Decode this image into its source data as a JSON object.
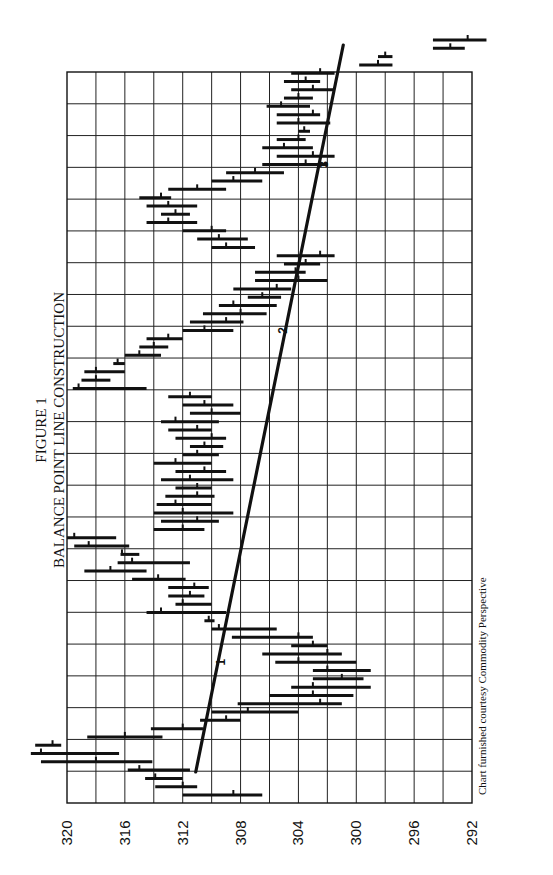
{
  "chart_data": {
    "type": "bar",
    "subtype": "high-low-close price bars with trend line",
    "title": "FIGURE 1",
    "subtitle": "BALANCE POINT LINE CONSTRUCTION",
    "credit": "Chart furnished courtesy Commodity Perspective",
    "orientation": "rotated 90 degrees counter-clockwise (time runs bottom to top, price runs left to right decreasing)",
    "price_axis": {
      "label": "",
      "ticks": [
        320,
        316,
        312,
        308,
        304,
        300,
        296,
        292
      ],
      "range": [
        292,
        320
      ],
      "grid": true
    },
    "time_axis": {
      "label": "",
      "grid": true,
      "divisions": 23
    },
    "balance_line": {
      "start": {
        "bar": 0,
        "price": 311.1
      },
      "end": {
        "bar": 92,
        "price": 300.9
      },
      "labels": [
        {
          "text": "1",
          "bar": 16,
          "price": 309.9
        },
        {
          "text": "2",
          "bar": 56,
          "price": 305.6
        },
        {
          "text": "3",
          "bar": 76,
          "price": 302.8
        }
      ]
    },
    "bars": [
      {
        "hi": 312.0,
        "lo": 306.5,
        "c": 308.5
      },
      {
        "hi": 313.9,
        "lo": 311.0,
        "c": 312.0
      },
      {
        "hi": 314.6,
        "lo": 312.0,
        "c": 313.9
      },
      {
        "hi": 315.8,
        "lo": 311.5,
        "c": 315.0
      },
      {
        "hi": 321.8,
        "lo": 314.1,
        "c": 318.0
      },
      {
        "hi": 322.5,
        "lo": 316.4,
        "c": 321.8
      },
      {
        "hi": 322.2,
        "lo": 320.4,
        "c": 321.0
      },
      {
        "hi": 318.6,
        "lo": 313.4,
        "c": 316.0
      },
      {
        "hi": 314.2,
        "lo": 310.6,
        "c": 312.0
      },
      {
        "hi": 310.8,
        "lo": 308.0,
        "c": 309.0
      },
      {
        "hi": 310.0,
        "lo": 304.0,
        "c": 307.5
      },
      {
        "hi": 308.2,
        "lo": 301.0,
        "c": 302.5
      },
      {
        "hi": 306.0,
        "lo": 300.2,
        "c": 303.0
      },
      {
        "hi": 304.5,
        "lo": 299.0,
        "c": 303.0
      },
      {
        "hi": 303.0,
        "lo": 299.5,
        "c": 301.0
      },
      {
        "hi": 303.0,
        "lo": 299.0,
        "c": 302.0
      },
      {
        "hi": 305.6,
        "lo": 300.0,
        "c": 304.0
      },
      {
        "hi": 306.5,
        "lo": 301.0,
        "c": 302.0
      },
      {
        "hi": 304.5,
        "lo": 302.0,
        "c": 303.0
      },
      {
        "hi": 308.6,
        "lo": 303.0,
        "c": 304.0
      },
      {
        "hi": 310.0,
        "lo": 305.5,
        "c": 309.5
      },
      {
        "hi": 310.5,
        "lo": 309.8,
        "c": 310.2
      },
      {
        "hi": 314.5,
        "lo": 309.0,
        "c": 313.5
      },
      {
        "hi": 312.5,
        "lo": 310.0,
        "c": 312.0
      },
      {
        "hi": 313.0,
        "lo": 310.5,
        "c": 311.5
      },
      {
        "hi": 313.0,
        "lo": 310.2,
        "c": 311.2
      },
      {
        "hi": 315.5,
        "lo": 311.8,
        "c": 313.7
      },
      {
        "hi": 318.8,
        "lo": 314.5,
        "c": 317.0
      },
      {
        "hi": 316.5,
        "lo": 311.5,
        "c": 315.5
      },
      {
        "hi": 316.3,
        "lo": 315.0,
        "c": 316.2
      },
      {
        "hi": 319.5,
        "lo": 315.7,
        "c": 318.5
      },
      {
        "hi": 320.0,
        "lo": 316.6,
        "c": 319.5
      },
      {
        "hi": 314.0,
        "lo": 310.5,
        "c": 312.0
      },
      {
        "hi": 313.5,
        "lo": 309.5,
        "c": 311.0
      },
      {
        "hi": 314.0,
        "lo": 308.5,
        "c": 312.0
      },
      {
        "hi": 313.8,
        "lo": 310.0,
        "c": 312.5
      },
      {
        "hi": 313.2,
        "lo": 309.8,
        "c": 311.0
      },
      {
        "hi": 312.5,
        "lo": 310.0,
        "c": 311.0
      },
      {
        "hi": 313.5,
        "lo": 308.5,
        "c": 311.5
      },
      {
        "hi": 312.5,
        "lo": 309.0,
        "c": 310.5
      },
      {
        "hi": 314.0,
        "lo": 310.0,
        "c": 312.5
      },
      {
        "hi": 312.0,
        "lo": 309.5,
        "c": 311.0
      },
      {
        "hi": 311.5,
        "lo": 309.2,
        "c": 310.5
      },
      {
        "hi": 312.5,
        "lo": 309.0,
        "c": 310.0
      },
      {
        "hi": 313.0,
        "lo": 310.0,
        "c": 311.0
      },
      {
        "hi": 313.5,
        "lo": 309.5,
        "c": 312.5
      },
      {
        "hi": 311.5,
        "lo": 308.0,
        "c": 310.0
      },
      {
        "hi": 312.0,
        "lo": 308.5,
        "c": 310.5
      },
      {
        "hi": 313.0,
        "lo": 310.0,
        "c": 311.5
      },
      {
        "hi": 319.6,
        "lo": 314.5,
        "c": 319.2
      },
      {
        "hi": 319.0,
        "lo": 317.0,
        "c": 318.0
      },
      {
        "hi": 318.8,
        "lo": 316.0,
        "c": 318.0
      },
      {
        "hi": 316.8,
        "lo": 316.0,
        "c": 316.5
      },
      {
        "hi": 316.0,
        "lo": 313.5,
        "c": 315.0
      },
      {
        "hi": 315.0,
        "lo": 313.0,
        "c": 314.0
      },
      {
        "hi": 314.5,
        "lo": 312.0,
        "c": 313.0
      },
      {
        "hi": 312.0,
        "lo": 308.5,
        "c": 310.5
      },
      {
        "hi": 311.5,
        "lo": 307.8,
        "c": 309.0
      },
      {
        "hi": 310.6,
        "lo": 306.2,
        "c": 308.0
      },
      {
        "hi": 309.5,
        "lo": 305.5,
        "c": 308.5
      },
      {
        "hi": 307.5,
        "lo": 305.2,
        "c": 306.5
      },
      {
        "hi": 308.5,
        "lo": 304.5,
        "c": 305.5
      },
      {
        "hi": 307.0,
        "lo": 302.0,
        "c": 304.0
      },
      {
        "hi": 307.0,
        "lo": 303.5,
        "c": 304.2
      },
      {
        "hi": 305.0,
        "lo": 302.5,
        "c": 303.5
      },
      {
        "hi": 305.5,
        "lo": 301.5,
        "c": 302.5
      },
      {
        "hi": 310.0,
        "lo": 307.0,
        "c": 309.0
      },
      {
        "hi": 311.0,
        "lo": 307.5,
        "c": 309.5
      },
      {
        "hi": 312.0,
        "lo": 309.0,
        "c": 310.0
      },
      {
        "hi": 314.5,
        "lo": 311.0,
        "c": 313.0
      },
      {
        "hi": 313.5,
        "lo": 311.5,
        "c": 312.5
      },
      {
        "hi": 314.5,
        "lo": 311.0,
        "c": 313.0
      },
      {
        "hi": 315.0,
        "lo": 312.8,
        "c": 313.5
      },
      {
        "hi": 313.0,
        "lo": 309.0,
        "c": 311.0
      },
      {
        "hi": 310.0,
        "lo": 306.5,
        "c": 308.5
      },
      {
        "hi": 309.0,
        "lo": 305.0,
        "c": 307.0
      },
      {
        "hi": 306.5,
        "lo": 302.0,
        "c": 303.5
      },
      {
        "hi": 305.5,
        "lo": 301.5,
        "c": 303.0
      },
      {
        "hi": 306.5,
        "lo": 303.0,
        "c": 305.0
      },
      {
        "hi": 305.5,
        "lo": 303.5,
        "c": 304.0
      },
      {
        "hi": 304.0,
        "lo": 303.2,
        "c": 303.6
      },
      {
        "hi": 305.5,
        "lo": 301.8,
        "c": 304.0
      },
      {
        "hi": 305.5,
        "lo": 302.5,
        "c": 303.0
      },
      {
        "hi": 306.2,
        "lo": 303.2,
        "c": 305.2
      },
      {
        "hi": 305.0,
        "lo": 303.0,
        "c": 304.0
      },
      {
        "hi": 304.5,
        "lo": 301.5,
        "c": 303.0
      },
      {
        "hi": 305.0,
        "lo": 302.5,
        "c": 303.5
      },
      {
        "hi": 304.5,
        "lo": 301.5,
        "c": 302.5
      },
      {
        "hi": 299.8,
        "lo": 297.5,
        "c": 298.5
      },
      {
        "hi": 298.5,
        "lo": 297.5,
        "c": 298.0
      },
      {
        "hi": 294.7,
        "lo": 292.5,
        "c": 293.5
      },
      {
        "hi": 294.7,
        "lo": 291.0,
        "c": 292.3
      }
    ]
  }
}
